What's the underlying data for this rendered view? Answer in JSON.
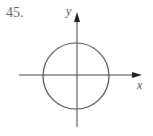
{
  "problem_number": "45.",
  "axes": {
    "x_label": "x",
    "y_label": "y"
  },
  "figure": {
    "shape": "circle",
    "center": [
      0,
      0
    ]
  }
}
